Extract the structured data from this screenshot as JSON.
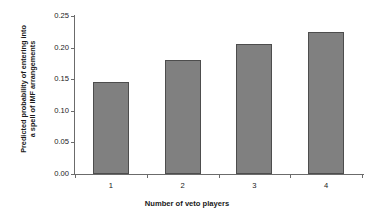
{
  "chart_data": {
    "type": "bar",
    "title": "",
    "categories": [
      "1",
      "2",
      "3",
      "4"
    ],
    "values": [
      0.145,
      0.181,
      0.206,
      0.224
    ],
    "xlabel": "Number of veto players",
    "ylabel_line1": "Predicted probability of entering into",
    "ylabel_line2": "a spell of IMF arrangements",
    "ylabel": "Predicted probability of entering into a spell of IMF arrangements",
    "ylim": [
      0.0,
      0.25
    ],
    "ytick_labels": [
      "0.00",
      "0.05",
      "0.10",
      "0.15",
      "0.20",
      "0.25"
    ],
    "ytick_values": [
      0.0,
      0.05,
      0.1,
      0.15,
      0.2,
      0.25
    ],
    "grid": false,
    "legend": "none",
    "bar_color": "#808080",
    "bar_border_color": "#4d4d4d",
    "axis_color": "#6b6b6b",
    "background": "#ffffff"
  }
}
